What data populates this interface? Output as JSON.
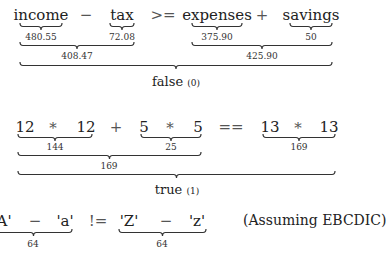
{
  "expressions": [
    {
      "tokens": [
        {
          "text": "income",
          "x": 41,
          "y": 8,
          "underline": true
        },
        {
          "text": "−",
          "x": 86,
          "y": 8
        },
        {
          "text": "tax",
          "x": 122,
          "y": 8,
          "underline": true
        },
        {
          "text": ">=",
          "x": 163,
          "y": 8
        },
        {
          "text": "expenses",
          "x": 217,
          "y": 8,
          "underline": true
        },
        {
          "text": "+",
          "x": 262,
          "y": 8
        },
        {
          "text": "savings",
          "x": 311,
          "y": 8,
          "underline": true
        }
      ],
      "braces": [
        {
          "x1": 20,
          "x2": 62,
          "y": 23,
          "label": "480.55",
          "lx": 41,
          "ly": 33
        },
        {
          "x1": 110,
          "x2": 134,
          "y": 23,
          "label": "72.08",
          "lx": 122,
          "ly": 33
        },
        {
          "x1": 192,
          "x2": 242,
          "y": 23,
          "label": "375.90",
          "lx": 217,
          "ly": 33
        },
        {
          "x1": 290,
          "x2": 332,
          "y": 23,
          "label": "50",
          "lx": 311,
          "ly": 33
        },
        {
          "x1": 20,
          "x2": 134,
          "y": 42,
          "label": "408.47",
          "lx": 77,
          "ly": 52
        },
        {
          "x1": 192,
          "x2": 332,
          "y": 42,
          "label": "425.90",
          "lx": 262,
          "ly": 52
        }
      ],
      "result_brace": {
        "x1": 20,
        "x2": 332,
        "y": 62
      },
      "result": {
        "text": "false",
        "code": "(0)",
        "x": 176,
        "y": 75
      }
    },
    {
      "tokens": [
        {
          "text": "12",
          "x": 25,
          "y": 120,
          "underline": true
        },
        {
          "text": "*",
          "x": 53,
          "y": 121
        },
        {
          "text": "12",
          "x": 86,
          "y": 120,
          "underline": true
        },
        {
          "text": "+",
          "x": 116,
          "y": 120
        },
        {
          "text": "5",
          "x": 144,
          "y": 120,
          "underline": true
        },
        {
          "text": "*",
          "x": 170,
          "y": 121
        },
        {
          "text": "5",
          "x": 198,
          "y": 120,
          "underline": true
        },
        {
          "text": "==",
          "x": 231,
          "y": 120
        },
        {
          "text": "13",
          "x": 270,
          "y": 120,
          "underline": true
        },
        {
          "text": "*",
          "x": 298,
          "y": 121
        },
        {
          "text": "13",
          "x": 329,
          "y": 120,
          "underline": true
        }
      ],
      "braces": [
        {
          "x1": 18,
          "x2": 92,
          "y": 134,
          "label": "144",
          "lx": 55,
          "ly": 143
        },
        {
          "x1": 141,
          "x2": 201,
          "y": 134,
          "label": "25",
          "lx": 171,
          "ly": 143
        },
        {
          "x1": 263,
          "x2": 335,
          "y": 134,
          "label": "169",
          "lx": 299,
          "ly": 143
        },
        {
          "x1": 18,
          "x2": 201,
          "y": 152,
          "label": "169",
          "lx": 109,
          "ly": 162
        }
      ],
      "result_brace": {
        "x1": 18,
        "x2": 335,
        "y": 171
      },
      "result": {
        "text": "true",
        "code": "(1)",
        "x": 177,
        "y": 183
      }
    },
    {
      "tokens": [
        {
          "text": "'A'",
          "x": 2,
          "y": 214
        },
        {
          "text": "−",
          "x": 35,
          "y": 214
        },
        {
          "text": "'a'",
          "x": 65,
          "y": 214
        },
        {
          "text": "!=",
          "x": 98,
          "y": 214
        },
        {
          "text": "'Z'",
          "x": 129,
          "y": 214
        },
        {
          "text": "−",
          "x": 166,
          "y": 214
        },
        {
          "text": "'z'",
          "x": 197,
          "y": 214
        }
      ],
      "braces": [
        {
          "x1": -5,
          "x2": 72,
          "y": 229,
          "label": "64",
          "lx": 33,
          "ly": 240
        },
        {
          "x1": 119,
          "x2": 206,
          "y": 229,
          "label": "64",
          "lx": 162,
          "ly": 240
        }
      ],
      "note": {
        "text": "(Assuming EBCDIC)",
        "x": 243,
        "y": 213
      }
    }
  ]
}
